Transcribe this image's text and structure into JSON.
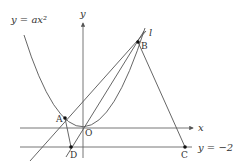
{
  "diagram": {
    "curve_label": "y = ax²",
    "y_axis_label": "y",
    "x_axis_label": "x",
    "line_label": "l",
    "horizontal_line_label": "y = −2",
    "points": {
      "A": "A",
      "B": "B",
      "C": "C",
      "D": "D",
      "O": "O"
    },
    "colors": {
      "lines": "#555555",
      "points": "#111111",
      "text": "#333333"
    }
  }
}
